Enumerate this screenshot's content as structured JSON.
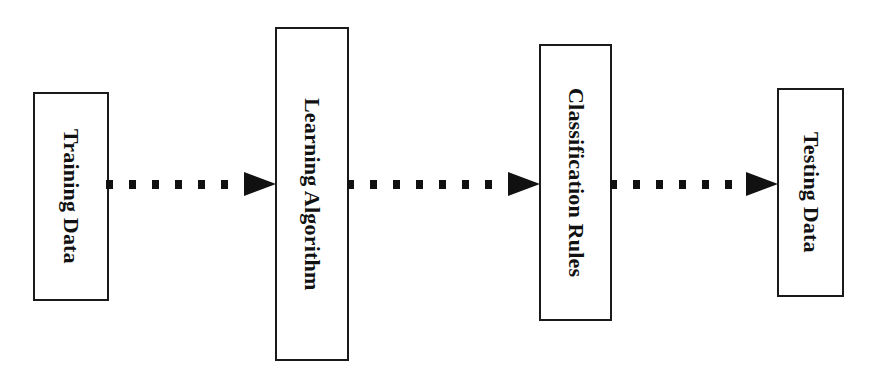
{
  "diagram": {
    "type": "flowchart",
    "direction": "left-to-right",
    "nodes": [
      {
        "id": "training",
        "label": "Training Data"
      },
      {
        "id": "learning",
        "label": "Learning Algorithm"
      },
      {
        "id": "rules",
        "label": "Classification Rules"
      },
      {
        "id": "testing",
        "label": "Testing Data"
      }
    ],
    "edges": [
      {
        "from": "training",
        "to": "learning",
        "style": "dotted-arrow"
      },
      {
        "from": "learning",
        "to": "rules",
        "style": "dotted-arrow"
      },
      {
        "from": "rules",
        "to": "testing",
        "style": "dotted-arrow"
      }
    ],
    "colors": {
      "stroke": "#111111",
      "background": "#ffffff"
    }
  }
}
